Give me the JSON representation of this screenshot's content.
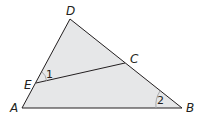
{
  "diagram": {
    "fill_color": "#e6e7e8",
    "stroke_color": "#231f20",
    "arc_color": "#a7a9ac",
    "vertices": {
      "A": {
        "label": "A",
        "x": 22,
        "y": 108
      },
      "B": {
        "label": "B",
        "x": 182,
        "y": 108
      },
      "D": {
        "label": "D",
        "x": 70,
        "y": 19
      },
      "C": {
        "label": "C",
        "x": 125,
        "y": 63
      },
      "E": {
        "label": "E",
        "x": 36,
        "y": 83
      }
    },
    "angles": [
      {
        "label": "1",
        "at": "E"
      },
      {
        "label": "2",
        "at": "B"
      }
    ]
  }
}
